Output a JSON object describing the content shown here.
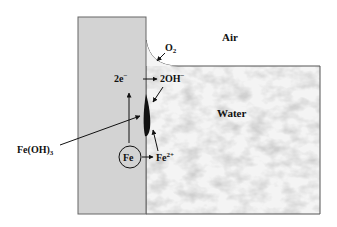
{
  "diagram": {
    "type": "corrosion-cell",
    "regions": {
      "air": "Air",
      "water": "Water"
    },
    "species": {
      "o2": {
        "base": "O",
        "sub": "2"
      },
      "electrons": {
        "base": "2e",
        "sup": "−"
      },
      "hydroxide": {
        "base": "2OH",
        "sup": "−"
      },
      "iron": "Fe",
      "ferrous": {
        "base": "Fe",
        "sup": "2+"
      },
      "rust": {
        "base": "Fe(OH)",
        "sub": "3"
      }
    },
    "colors": {
      "metal": "#d3d3d3",
      "water": "#f2f2f2",
      "outline": "#555555",
      "deposit": "#111111"
    }
  }
}
